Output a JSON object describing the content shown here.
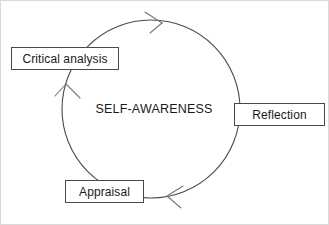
{
  "diagram": {
    "center_label": "SELF-AWARENESS",
    "stroke_color": "#4a4a4a",
    "text_color": "#1a1a1a",
    "background_color": "#ffffff",
    "frame_color": "#d9d9d9",
    "cycle": {
      "shape": "circle",
      "direction": "clockwise",
      "center_x": 151,
      "center_y": 109,
      "radius": 89
    },
    "nodes": [
      {
        "id": "critical-analysis",
        "label": "Critical analysis",
        "position": "upper-left"
      },
      {
        "id": "reflection",
        "label": "Reflection",
        "position": "right"
      },
      {
        "id": "appraisal",
        "label": "Appraisal",
        "position": "bottom-left"
      }
    ],
    "arrowheads": [
      {
        "id": "arrow-top",
        "at_degrees": 285,
        "points": "clockwise"
      },
      {
        "id": "arrow-left",
        "at_degrees": 160,
        "points": "clockwise"
      },
      {
        "id": "arrow-bottom",
        "at_degrees": 70,
        "points": "clockwise"
      }
    ]
  }
}
